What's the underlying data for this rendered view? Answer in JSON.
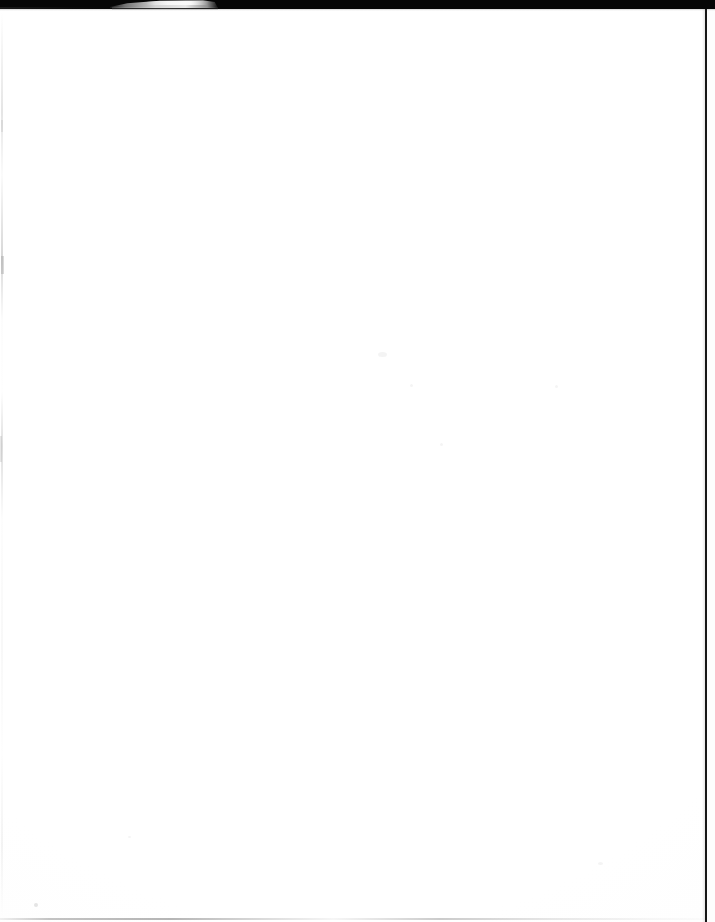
{
  "document": {
    "kind": "scanned-page",
    "page_content_text": "",
    "page_note": "blank page",
    "width_px": 715,
    "height_px": 922
  },
  "colors": {
    "page_background": "#fefefe",
    "scanner_lid_band": "#060606",
    "right_edge_rule": "#161616",
    "paper_edge_highlight": "#ececec",
    "faint_artifact_grey": "#b4b4b4"
  },
  "artifacts": {
    "top_lid_band": {
      "label": "scanner lid band",
      "height_px": 9
    },
    "paper_edge_wedge": {
      "label": "lifted paper edge",
      "left_px": 110,
      "width_px": 108
    },
    "right_edge_rule": {
      "label": "right edge rule",
      "left_px": 705,
      "width_px": 2
    },
    "bottom_rule": {
      "label": "bottom edge line",
      "top_px": 918
    },
    "left_margin_line": {
      "label": "left margin scan streak"
    }
  }
}
